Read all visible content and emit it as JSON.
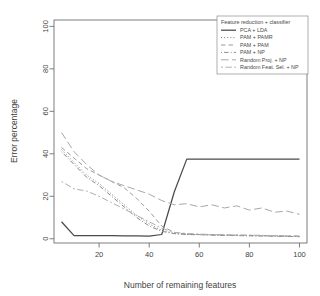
{
  "figure": {
    "top_caption": "",
    "background": "#ffffff"
  },
  "chart_data": {
    "type": "line",
    "title": "",
    "xlabel": "Number of remaining features",
    "ylabel": "Error percentage",
    "xlim": [
      2,
      103
    ],
    "ylim": [
      -2,
      103
    ],
    "xticks": [
      20,
      40,
      60,
      80,
      100
    ],
    "yticks": [
      0,
      20,
      40,
      60,
      80,
      100
    ],
    "grid": false,
    "legend_position": "top-right",
    "legend_title": "Feature reduction + classifier",
    "x": [
      5,
      10,
      15,
      20,
      25,
      30,
      35,
      40,
      45,
      50,
      55,
      60,
      65,
      70,
      75,
      80,
      85,
      90,
      95,
      100
    ],
    "series": [
      {
        "name": "PCA + LDA",
        "linestyle": "solid",
        "color": "#4a4a4a",
        "values": [
          8.0,
          1.5,
          1.5,
          1.5,
          1.5,
          1.4,
          1.3,
          1.2,
          2.0,
          22.0,
          37.5,
          37.5,
          37.5,
          37.5,
          37.5,
          37.5,
          37.5,
          37.5,
          37.5,
          37.5
        ]
      },
      {
        "name": "PAM + PAMR",
        "linestyle": "dotted",
        "color": "#7d7d7d",
        "values": [
          42.0,
          36.0,
          30.0,
          26.0,
          21.0,
          16.0,
          11.0,
          7.0,
          4.0,
          2.5,
          2.0,
          2.0,
          1.8,
          1.6,
          1.5,
          1.4,
          1.3,
          1.2,
          1.1,
          1.0
        ]
      },
      {
        "name": "PAM + PAM",
        "linestyle": "dashed",
        "color": "#9a9a9a",
        "values": [
          43.0,
          38.0,
          33.0,
          30.0,
          27.0,
          24.0,
          19.0,
          13.0,
          6.0,
          3.0,
          2.2,
          2.0,
          1.9,
          1.8,
          1.7,
          1.6,
          1.5,
          1.4,
          1.3,
          1.2
        ]
      },
      {
        "name": "PAM + NP",
        "linestyle": "dotdash",
        "color": "#8a8a8a",
        "values": [
          41.0,
          35.0,
          29.0,
          25.0,
          20.0,
          15.0,
          10.0,
          6.0,
          3.5,
          2.4,
          2.0,
          1.9,
          1.7,
          1.6,
          1.5,
          1.4,
          1.3,
          1.2,
          1.1,
          1.0
        ]
      },
      {
        "name": "Random Proj. + NP",
        "linestyle": "longdash",
        "color": "#a8a8a8",
        "values": [
          50.0,
          41.0,
          35.0,
          30.0,
          27.0,
          25.0,
          23.0,
          21.0,
          18.0,
          16.0,
          16.5,
          15.0,
          16.0,
          14.5,
          15.5,
          13.5,
          14.5,
          12.5,
          13.0,
          11.5
        ]
      },
      {
        "name": "Random Feat. Sel. + NP",
        "linestyle": "twodash",
        "color": "#b0b0b0",
        "values": [
          27.0,
          23.5,
          22.5,
          20.0,
          17.0,
          14.0,
          11.0,
          8.0,
          5.0,
          3.0,
          2.5,
          2.2,
          2.0,
          1.9,
          1.8,
          1.7,
          1.6,
          1.5,
          1.4,
          1.3
        ]
      }
    ]
  },
  "legend": {
    "title": "Feature reduction + classifier",
    "entries": [
      "PCA + LDA",
      "PAM + PAMR",
      "PAM + PAM",
      "PAM + NP",
      "Random Proj. + NP",
      "Random Feat. Sel. + NP"
    ]
  },
  "axes": {
    "x_title": "Number of remaining features",
    "y_title": "Error percentage",
    "x_tick_labels": [
      "20",
      "40",
      "60",
      "80",
      "100"
    ],
    "y_tick_labels": [
      "0",
      "20",
      "40",
      "60",
      "80",
      "100"
    ]
  }
}
